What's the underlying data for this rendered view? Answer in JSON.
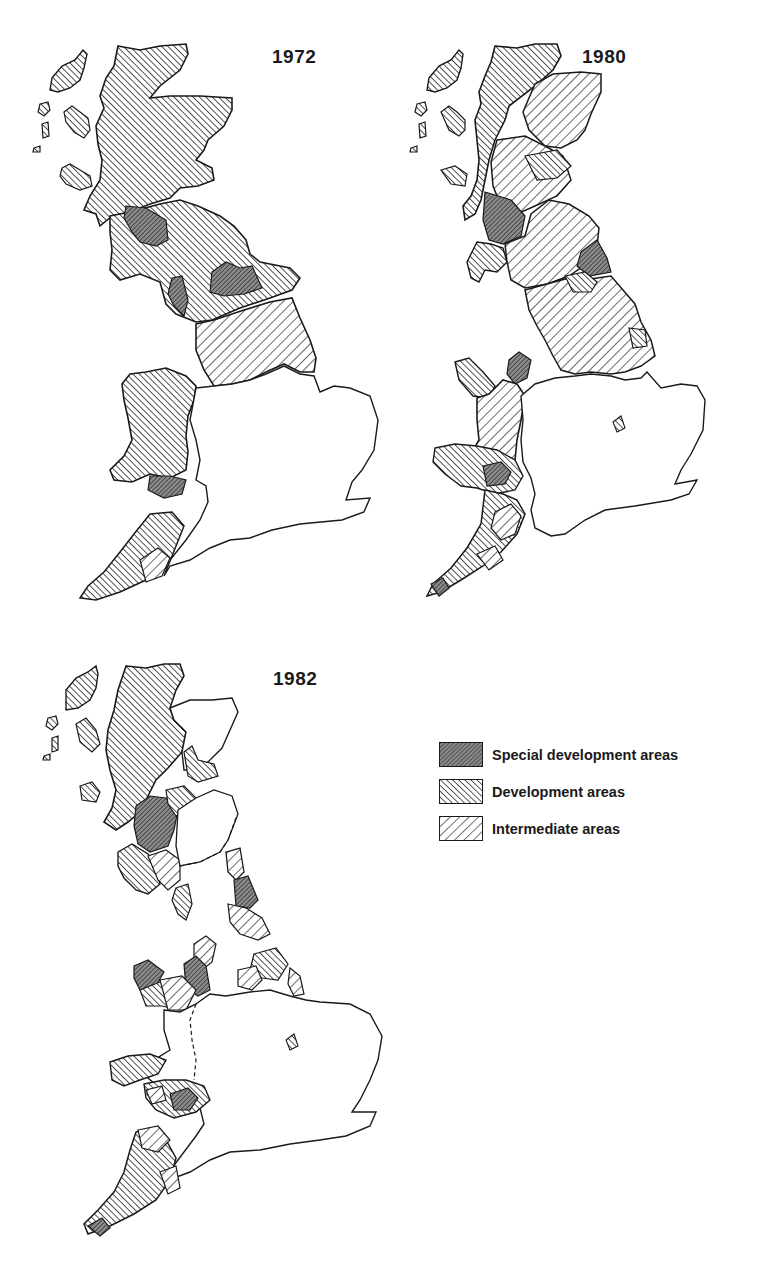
{
  "figure": {
    "panels": [
      {
        "year": "1972"
      },
      {
        "year": "1980"
      },
      {
        "year": "1982"
      }
    ]
  },
  "legend": {
    "items": [
      {
        "label": "Special development areas",
        "pattern": "dense-diagonal-down",
        "fill": "#9a9a9a"
      },
      {
        "label": "Development areas",
        "pattern": "diagonal-up",
        "fill": "#d4d4d4"
      },
      {
        "label": "Intermediate areas",
        "pattern": "diagonal-down",
        "fill": "#ffffff"
      }
    ]
  },
  "colors": {
    "outline": "#1a1a1a",
    "background": "#ffffff",
    "hatch": "#1a1a1a"
  }
}
